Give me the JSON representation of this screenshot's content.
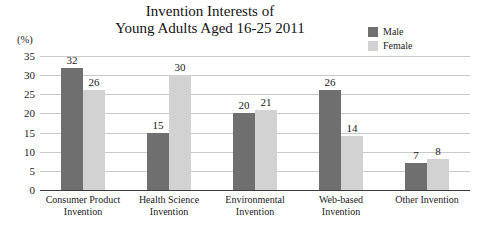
{
  "chart_data": {
    "type": "bar",
    "title": "Invention Interests of Young Adults Aged 16-25 2011",
    "title_lines": [
      "Invention Interests of",
      "Young Adults Aged 16-25 2011"
    ],
    "xlabel": "",
    "ylabel": "(%)",
    "ylim": [
      0,
      35
    ],
    "yticks": [
      35,
      30,
      25,
      20,
      15,
      10,
      5,
      0
    ],
    "grid": true,
    "legend_position": "top-right",
    "categories": [
      "Consumer Product Invention",
      "Health Science Invention",
      "Environmental Invention",
      "Web-based Invention",
      "Other Invention"
    ],
    "category_lines": [
      [
        "Consumer Product",
        "Invention"
      ],
      [
        "Health Science",
        "Invention"
      ],
      [
        "Environmental",
        "Invention"
      ],
      [
        "Web-based",
        "Invention"
      ],
      [
        "Other Invention"
      ]
    ],
    "series": [
      {
        "name": "Male",
        "color": "#6f6f6f",
        "values": [
          32,
          15,
          20,
          26,
          7
        ]
      },
      {
        "name": "Female",
        "color": "#d2d2d2",
        "values": [
          26,
          30,
          21,
          14,
          8
        ]
      }
    ]
  }
}
